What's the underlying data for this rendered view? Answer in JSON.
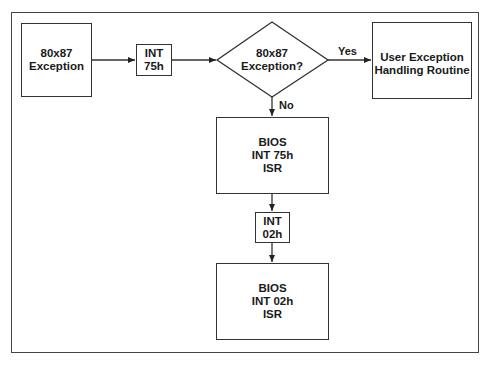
{
  "diagram": {
    "type": "flowchart",
    "nodes": {
      "exception": {
        "lines": [
          "80x87",
          "Exception"
        ]
      },
      "int75": {
        "lines": [
          "INT",
          "75h"
        ]
      },
      "decision": {
        "lines": [
          "80x87",
          "Exception?"
        ]
      },
      "user_routine": {
        "lines": [
          "User Exception",
          "Handling Routine"
        ]
      },
      "bios75": {
        "lines": [
          "BIOS",
          "INT 75h",
          "ISR"
        ]
      },
      "int02": {
        "lines": [
          "INT",
          "02h"
        ]
      },
      "bios02": {
        "lines": [
          "BIOS",
          "INT 02h",
          "ISR"
        ]
      }
    },
    "edges": {
      "yes_label": "Yes",
      "no_label": "No"
    },
    "colors": {
      "stroke": "#333333",
      "background": "#ffffff"
    }
  }
}
